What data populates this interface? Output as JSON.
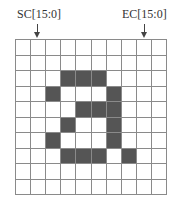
{
  "labels": {
    "start_column": "SC[15:0]",
    "end_column": "EC[15:0]"
  },
  "grid": {
    "rows": 10,
    "cols": 10,
    "fill_color": "#555555",
    "line_color": "#8a8a8a",
    "pixels": [
      [
        0,
        0,
        0,
        0,
        0,
        0,
        0,
        0,
        0,
        0
      ],
      [
        0,
        0,
        0,
        0,
        0,
        0,
        0,
        0,
        0,
        0
      ],
      [
        0,
        0,
        0,
        1,
        1,
        1,
        0,
        0,
        0,
        0
      ],
      [
        0,
        0,
        1,
        0,
        0,
        0,
        1,
        0,
        0,
        0
      ],
      [
        0,
        0,
        0,
        0,
        1,
        1,
        1,
        0,
        0,
        0
      ],
      [
        0,
        0,
        0,
        1,
        0,
        0,
        1,
        0,
        0,
        0
      ],
      [
        0,
        0,
        1,
        0,
        0,
        0,
        1,
        0,
        0,
        0
      ],
      [
        0,
        0,
        0,
        1,
        1,
        1,
        0,
        1,
        0,
        0
      ],
      [
        0,
        0,
        0,
        0,
        0,
        0,
        0,
        0,
        0,
        0
      ],
      [
        0,
        0,
        0,
        0,
        0,
        0,
        0,
        0,
        0,
        0
      ]
    ],
    "glyph": "a",
    "start_column_index": 1,
    "end_column_index": 8
  }
}
